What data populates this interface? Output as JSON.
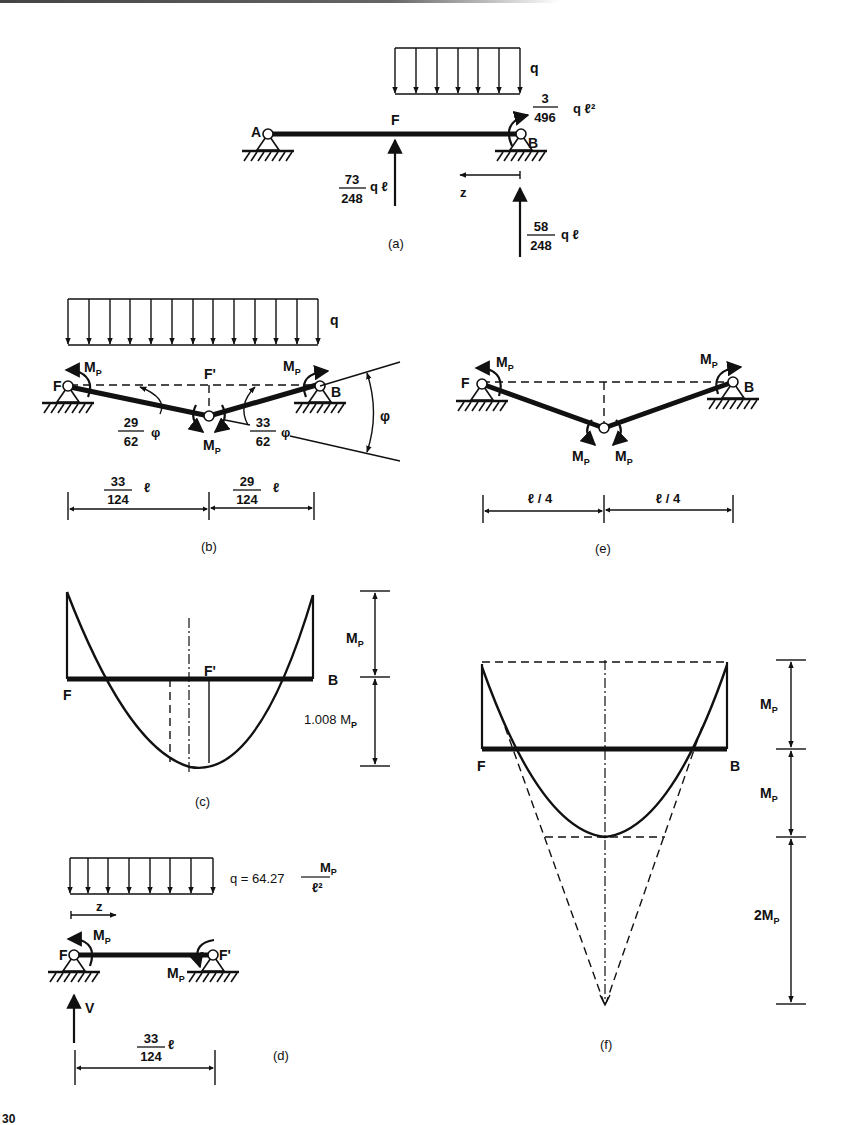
{
  "page": {
    "page_number_partial": "30"
  },
  "panels": {
    "a": {
      "caption": "(a)",
      "load_label": "q",
      "nodes": {
        "left": "A",
        "mid": "F",
        "right": "B"
      },
      "moment_B": {
        "numerator": "3",
        "denominator": "496",
        "suffix": "q ℓ²"
      },
      "reaction_F": {
        "numerator": "73",
        "denominator": "248",
        "suffix": "q ℓ"
      },
      "reaction_B": {
        "numerator": "58",
        "denominator": "248",
        "suffix": "q ℓ"
      },
      "axis_label": "z"
    },
    "b": {
      "caption": "(b)",
      "load_label": "q",
      "nodes": {
        "left": "F",
        "mid": "F'",
        "right": "B"
      },
      "moment_label": "M",
      "moment_sub": "P",
      "angle_left": {
        "numerator": "29",
        "denominator": "62",
        "suffix": "φ"
      },
      "angle_right": {
        "numerator": "33",
        "denominator": "62",
        "suffix": "φ"
      },
      "angle_total": "φ",
      "dim_left": {
        "numerator": "33",
        "denominator": "124",
        "suffix": "ℓ"
      },
      "dim_right": {
        "numerator": "29",
        "denominator": "124",
        "suffix": "ℓ"
      }
    },
    "c": {
      "caption": "(c)",
      "nodes": {
        "left": "F",
        "mid": "F'",
        "right": "B"
      },
      "dim_top": {
        "main": "M",
        "sub": "P"
      },
      "dim_bottom": {
        "main": "1.008 M",
        "sub": "P"
      }
    },
    "d": {
      "caption": "(d)",
      "load_formula": {
        "prefix": "q = 64.27",
        "numerator_main": "M",
        "numerator_sub": "P",
        "denominator": "ℓ²"
      },
      "axis_label": "z",
      "nodes": {
        "left": "F",
        "right": "F'"
      },
      "moment_label": "M",
      "moment_sub": "P",
      "reaction_label": "V",
      "dim": {
        "numerator": "33",
        "denominator": "124",
        "suffix": "ℓ"
      }
    },
    "e": {
      "caption": "(e)",
      "nodes": {
        "left": "F",
        "right": "B"
      },
      "moment_label": "M",
      "moment_sub": "P",
      "dim_left": "ℓ / 4",
      "dim_right": "ℓ / 4"
    },
    "f": {
      "caption": "(f)",
      "nodes": {
        "left": "F",
        "right": "B"
      },
      "dim_1": {
        "main": "M",
        "sub": "P"
      },
      "dim_2": {
        "main": "M",
        "sub": "P"
      },
      "dim_3": {
        "main": "2M",
        "sub": "P"
      }
    }
  }
}
